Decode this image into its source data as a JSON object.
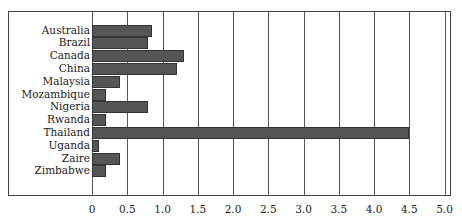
{
  "chart_data": {
    "type": "bar",
    "orientation": "horizontal",
    "title": "",
    "xlabel": "",
    "ylabel": "",
    "categories": [
      "Australia",
      "Brazil",
      "Canada",
      "China",
      "Malaysia",
      "Mozambique",
      "Nigeria",
      "Rwanda",
      "Thailand",
      "Uganda",
      "Zaire",
      "Zimbabwe"
    ],
    "values": [
      0.85,
      0.8,
      1.3,
      1.2,
      0.4,
      0.2,
      0.8,
      0.2,
      4.5,
      0.1,
      0.4,
      0.2
    ],
    "xlim": [
      0,
      5.0
    ],
    "xticks": [
      "0",
      "0.5",
      "1.0",
      "1.5",
      "2.0",
      "2.5",
      "3.0",
      "3.5",
      "4.0",
      "4.5",
      "5.0"
    ],
    "grid": "vertical",
    "legend": null,
    "bar_fill": "crosshatch-gray"
  }
}
